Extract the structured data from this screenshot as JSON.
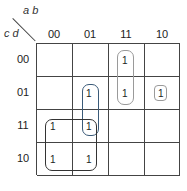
{
  "row_variables": "c d",
  "col_variables": "a b",
  "columns": [
    "00",
    "01",
    "11",
    "10"
  ],
  "rows": [
    "00",
    "01",
    "11",
    "10"
  ],
  "cells": [
    [
      "",
      "",
      "1",
      ""
    ],
    [
      "",
      "1",
      "1",
      "1"
    ],
    [
      "1",
      "1",
      "",
      ""
    ],
    [
      "1",
      "1",
      "",
      ""
    ]
  ],
  "loops": [
    {
      "name": "loop-ab11-cd00-01",
      "color": "#9a9a9a"
    },
    {
      "name": "loop-ab10-cd01",
      "color": "#9a9a9a"
    },
    {
      "name": "loop-ab01-cd01-11",
      "color": "#3a5a78"
    },
    {
      "name": "loop-ab00-01-cd11-10",
      "color": "#333333"
    }
  ]
}
